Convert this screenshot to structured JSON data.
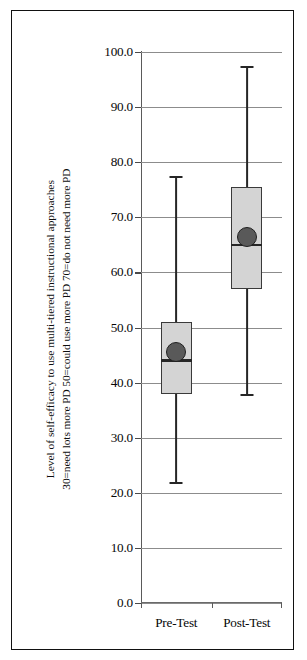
{
  "chart_data": {
    "type": "box",
    "title": "",
    "xlabel": "",
    "ylabel_line1": "Level of self-efficacy  to use multi-tiered instructional approaches",
    "ylabel_line2": "30=need lots more PD   50=could use more PD   70=do not need more PD",
    "categories": [
      "Pre-Test",
      "Post-Test"
    ],
    "ylim": [
      0.0,
      100.0
    ],
    "ytick_step": 10.0,
    "ytick_labels": [
      "100.0",
      "90.0",
      "80.0",
      "70.0",
      "60.0",
      "50.0",
      "40.0",
      "30.0",
      "20.0",
      "10.0",
      "0.0"
    ],
    "ytick_values": [
      100.0,
      90.0,
      80.0,
      70.0,
      60.0,
      50.0,
      40.0,
      30.0,
      20.0,
      10.0,
      0.0
    ],
    "grid": true,
    "legend": "none",
    "boxes": [
      {
        "name": "Pre-Test",
        "whisker_low": 22.0,
        "q1": 38.0,
        "median": 44.0,
        "q3": 51.0,
        "whisker_high": 77.5,
        "mean": 45.5
      },
      {
        "name": "Post-Test",
        "whisker_low": 38.0,
        "q1": 57.0,
        "median": 65.0,
        "q3": 75.5,
        "whisker_high": 97.5,
        "mean": 66.5
      }
    ],
    "colors": {
      "box_fill": "#d4d4d4",
      "box_border": "#3a3a3a",
      "whisker": "#262626",
      "mean_marker": "#595959",
      "gridline": "#8c8c8c",
      "background": "#ffffff",
      "frame": "#111111",
      "text": "#070707"
    }
  }
}
